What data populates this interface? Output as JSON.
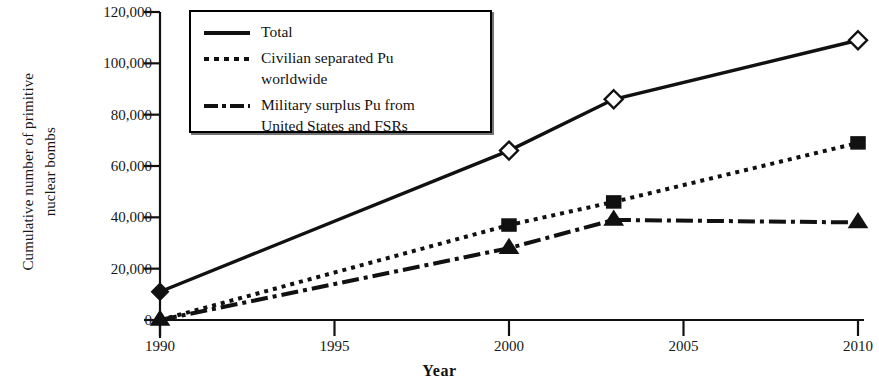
{
  "chart_data": {
    "type": "line",
    "title": "",
    "xlabel": "Year",
    "ylabel": "Cumulative number of primitive\nnuclear bombs",
    "ylabel_line1": "Cumulative number of primitive",
    "ylabel_line2": "nuclear bombs",
    "xlim": [
      1990,
      2010
    ],
    "ylim": [
      0,
      120000
    ],
    "grid": false,
    "legend_position": "top-left-inside",
    "xticks": [
      1990,
      1995,
      2000,
      2005,
      2010
    ],
    "xtick_labels": [
      "1990",
      "1995",
      "2000",
      "2005",
      "2010"
    ],
    "yticks": [
      0,
      20000,
      40000,
      60000,
      80000,
      100000,
      120000
    ],
    "ytick_labels": [
      "0",
      "20,000",
      "40,000",
      "60,000",
      "80,000",
      "100,000",
      "120,000"
    ],
    "series": [
      {
        "name": "Total",
        "legend_label": "Total",
        "line_style": "solid",
        "marker": "diamond-open",
        "color": "#111111",
        "x": [
          1990,
          2000,
          2003,
          2010
        ],
        "values": [
          11000,
          66000,
          86000,
          109000
        ]
      },
      {
        "name": "Civilian separated Pu worldwide",
        "legend_label": "Civilian separated Pu\nworldwide",
        "line_style": "dotted",
        "marker": "square-filled",
        "color": "#111111",
        "x": [
          1990,
          2000,
          2003,
          2010
        ],
        "values": [
          0,
          37000,
          46000,
          69000
        ]
      },
      {
        "name": "Military surplus Pu from United States and FSRs",
        "legend_label": "Military surplus Pu from\nUnited States and FSRs",
        "line_style": "dash-dot",
        "marker": "triangle-filled",
        "color": "#111111",
        "x": [
          1990,
          2000,
          2003,
          2010
        ],
        "values": [
          0,
          28000,
          39000,
          38000
        ]
      }
    ]
  },
  "legend": {
    "items": [
      {
        "label": "Total",
        "style": "solid"
      },
      {
        "label": "Civilian separated Pu\nworldwide",
        "style": "dotted"
      },
      {
        "label": "Military surplus Pu from\nUnited States and FSRs",
        "style": "dash-dot"
      }
    ]
  }
}
